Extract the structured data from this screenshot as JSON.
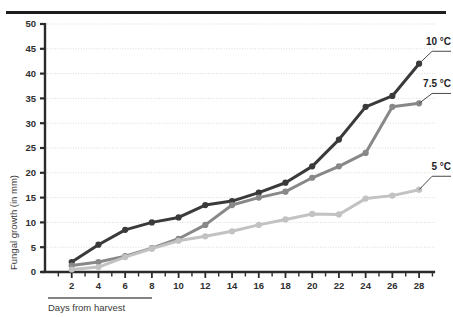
{
  "chart_data": {
    "type": "line",
    "title": "",
    "subtitle": "",
    "xlabel": "Days from harvest",
    "ylabel": "Fungal growth (in mm)",
    "x": [
      2,
      4,
      6,
      8,
      10,
      12,
      14,
      16,
      18,
      20,
      22,
      24,
      26,
      28
    ],
    "xlim": [
      0,
      29
    ],
    "ylim": [
      0,
      50
    ],
    "xticks": [
      "2",
      "4",
      "6",
      "8",
      "10",
      "12",
      "14",
      "16",
      "18",
      "20",
      "22",
      "24",
      "26",
      "28"
    ],
    "yticks": [
      "0",
      "5",
      "10",
      "15",
      "20",
      "25",
      "30",
      "35",
      "40",
      "45",
      "50"
    ],
    "grid": true,
    "grid_axis": "y",
    "legend_position": "right-inline-labels",
    "markers": "filled-circle",
    "series": [
      {
        "name": "10 °C",
        "color": "#3a3a3a",
        "values": [
          2,
          5.5,
          8.5,
          10,
          11,
          13.5,
          14.3,
          16,
          18,
          21.3,
          26.7,
          33.3,
          35.5,
          42
        ],
        "label_y": 44.5
      },
      {
        "name": "7.5 °C",
        "color": "#888888",
        "values": [
          1.3,
          2,
          3.2,
          4.8,
          6.7,
          9.5,
          13.5,
          15,
          16.2,
          19,
          21.3,
          24,
          33.3,
          34
        ],
        "label_y": 36
      },
      {
        "name": "5 °C",
        "color": "#c2c2c2",
        "values": [
          0.5,
          1,
          3,
          4.7,
          6.3,
          7.2,
          8.2,
          9.5,
          10.6,
          11.7,
          11.6,
          14.8,
          15.4,
          16.6
        ],
        "label_y": 19.3
      }
    ]
  },
  "colors": {
    "axis": "#2b2b2b",
    "grid": "#d8d8d8",
    "top_rule": "#1d1d1d",
    "series_10c": "#3a3a3a",
    "series_75c": "#888888",
    "series_5c": "#c2c2c2"
  }
}
